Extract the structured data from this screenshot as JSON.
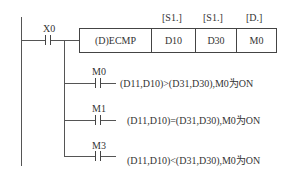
{
  "main_contact": {
    "label": "X0"
  },
  "instruction": {
    "name": "(D)ECMP",
    "operands": [
      {
        "header": "[S1.]",
        "value": "D10"
      },
      {
        "header": "[S1.]",
        "value": "D30"
      },
      {
        "header": "[D.]",
        "value": "M0"
      }
    ]
  },
  "branches": [
    {
      "contact": "M0",
      "text": "(D11,D10)>(D31,D30),M0为ON"
    },
    {
      "contact": "M1",
      "text": "(D11,D10)=(D31,D30),M0为ON"
    },
    {
      "contact": "M3",
      "text": "(D11,D10)<(D31,D30),M0为ON"
    }
  ]
}
